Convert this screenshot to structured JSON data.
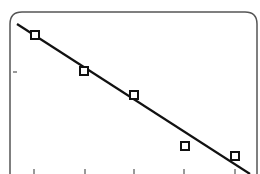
{
  "chart_data": {
    "type": "scatter",
    "title": "",
    "xlabel": "",
    "ylabel": "",
    "x": [
      1,
      2,
      3,
      4,
      5
    ],
    "series": [
      {
        "name": "observed",
        "marker": "open-square",
        "values": [
          4.6,
          3.8,
          3.3,
          2.2,
          2.0
        ]
      },
      {
        "name": "fit",
        "style": "line",
        "values": [
          4.62,
          3.97,
          3.32,
          2.67,
          2.02
        ]
      }
    ],
    "x_ticks": [
      1,
      2,
      3,
      4,
      5
    ],
    "tick_labels_visible": false,
    "grid": false,
    "legend": "none"
  },
  "colors": {
    "frame": "#555555",
    "line": "#111111",
    "marker": "#111111",
    "background": "#ffffff"
  },
  "frame": {
    "left": 10,
    "top": 12,
    "right": 257,
    "radius": 12
  },
  "points_px": [
    [
      35,
      35
    ],
    [
      84,
      71
    ],
    [
      134,
      95
    ],
    [
      185,
      146
    ],
    [
      235,
      156
    ]
  ],
  "fit_line_px": {
    "x1": 17,
    "y1": 24,
    "x2": 250,
    "y2": 174
  },
  "x_tick_px": [
    34,
    85,
    134,
    184,
    235
  ],
  "y_tick_px": [
    72
  ]
}
